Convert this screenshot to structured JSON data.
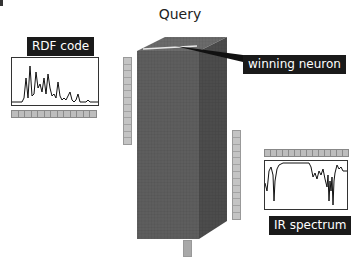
{
  "title": "Query",
  "labels": {
    "rdf": "RDF code",
    "neuron": "winning neuron",
    "ir": "IR spectrum"
  },
  "strips": {
    "rdf_cells": 13,
    "ir_cells": 14,
    "left_vertical_cells": 13,
    "right_vertical_cells": 13
  },
  "colors": {
    "cube_front": "#5c5c5c",
    "cube_side": "#4a4a4a",
    "cube_top": "#6a6a6a",
    "strip": "#bdbdbd",
    "label_bg": "#1a1a1a",
    "label_text": "#ffffff"
  }
}
